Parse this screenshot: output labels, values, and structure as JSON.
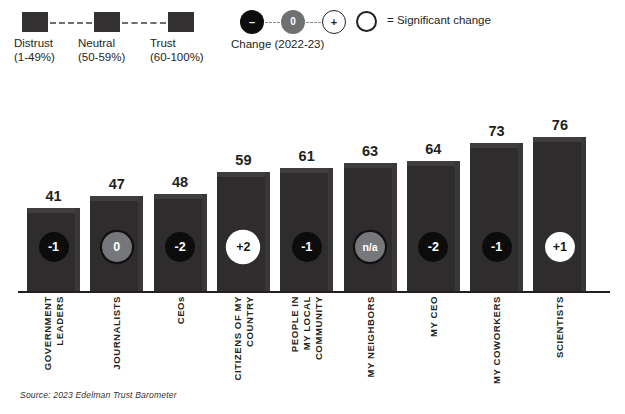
{
  "legend": {
    "scale": {
      "items": [
        {
          "label": "Distrust",
          "range": "(1-49%)",
          "swatch_color": "#333132"
        },
        {
          "label": "Neutral",
          "range": "(50-59%)",
          "swatch_color": "#333132"
        },
        {
          "label": "Trust",
          "range": "(60-100%)",
          "swatch_color": "#333132"
        }
      ]
    },
    "change": {
      "title": "Change (2022-23)",
      "markers": [
        {
          "symbol": "–",
          "name": "negative-change-marker",
          "fill": "#0d0d0d"
        },
        {
          "symbol": "0",
          "name": "no-change-marker",
          "fill": "#6f7072"
        },
        {
          "symbol": "+",
          "name": "positive-change-marker",
          "fill": "#ffffff"
        }
      ]
    },
    "significant": {
      "text": "= Significant change",
      "ring_color": "#231f20"
    }
  },
  "chart_data": {
    "type": "bar",
    "title": "",
    "xlabel": "",
    "ylabel": "",
    "ylim": [
      0,
      100
    ],
    "grid": false,
    "legend_position": "top",
    "source": "Source: 2023 Edelman Trust Barometer",
    "categories": [
      "GOVERNMENT LEADERS",
      "JOURNALISTS",
      "CEOs",
      "CITIZENS OF MY COUNTRY",
      "PEOPLE IN MY LOCAL COMMUNITY",
      "MY NEIGHBORS",
      "MY CEO",
      "MY COWORKERS",
      "SCIENTISTS"
    ],
    "category_lines": [
      [
        "GOVERNMENT",
        "LEADERS"
      ],
      [
        "JOURNALISTS"
      ],
      [
        "CEOs"
      ],
      [
        "CITIZENS OF MY",
        "COUNTRY"
      ],
      [
        "PEOPLE IN",
        "MY LOCAL",
        "COMMUNITY"
      ],
      [
        "MY NEIGHBORS"
      ],
      [
        "MY CEO"
      ],
      [
        "MY COWORKERS"
      ],
      [
        "SCIENTISTS"
      ]
    ],
    "values": [
      41,
      47,
      48,
      59,
      61,
      63,
      64,
      73,
      76
    ],
    "change_labels": [
      "-1",
      "0",
      "-2",
      "+2",
      "-1",
      "n/a",
      "-2",
      "-1",
      "+1"
    ],
    "change_values": [
      -1,
      0,
      -2,
      2,
      -1,
      null,
      -2,
      -1,
      1
    ],
    "change_styles": [
      "neg",
      "zero ringdark",
      "neg",
      "pos ring",
      "neg",
      "na ringdark",
      "neg",
      "neg",
      "pos"
    ],
    "significant": [
      false,
      true,
      false,
      true,
      false,
      false,
      false,
      false,
      false
    ],
    "bar_color": "#2e2c2d"
  }
}
